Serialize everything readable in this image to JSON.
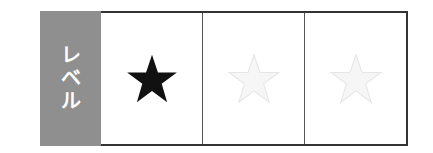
{
  "level_rating": {
    "label": "レベル",
    "label_chars": [
      "レ",
      "ベ",
      "ル"
    ],
    "max_stars": 3,
    "filled_stars": 1,
    "stars": [
      {
        "state": "filled",
        "icon": "star-filled-icon",
        "color": "#111111"
      },
      {
        "state": "empty",
        "icon": "star-empty-icon",
        "color": "#eeeeee"
      },
      {
        "state": "empty",
        "icon": "star-empty-icon",
        "color": "#eeeeee"
      }
    ],
    "colors": {
      "label_bg": "#8f8f8f",
      "label_text": "#ffffff",
      "border": "#333333"
    }
  }
}
